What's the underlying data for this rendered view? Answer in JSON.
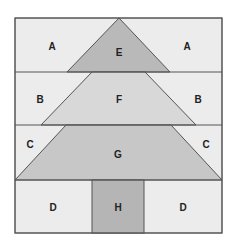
{
  "diagram": {
    "type": "quilt-block-tree",
    "colors": {
      "background": "#ececec",
      "E": "#b9b9b9",
      "F": "#d8d8d8",
      "G": "#c7c7c7",
      "H": "#b5b5b5",
      "stroke": "#555555"
    },
    "labels": {
      "a_left": "A",
      "a_right": "A",
      "e": "E",
      "b_left": "B",
      "f": "F",
      "b_right": "B",
      "c_left": "C",
      "g": "G",
      "c_right": "C",
      "d_left": "D",
      "h": "H",
      "d_right": "D"
    }
  }
}
